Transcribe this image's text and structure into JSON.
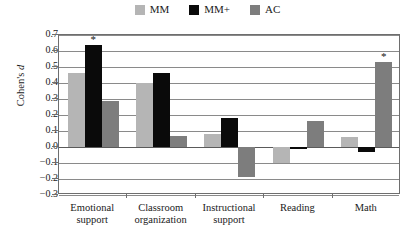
{
  "legend": {
    "position": "top-center",
    "entries": [
      {
        "label": "MM",
        "color": "#b5b5b5",
        "swatch_name": "legend-swatch-mm"
      },
      {
        "label": "MM+",
        "color": "#0a0a0a",
        "swatch_name": "legend-swatch-mmplus"
      },
      {
        "label": "AC",
        "color": "#7d7d7d",
        "swatch_name": "legend-swatch-ac"
      }
    ]
  },
  "axes": {
    "ylabel_prefix": "Cohen's ",
    "ylabel_italic": "d",
    "ytick_labels": [
      "0.7",
      "0.6",
      "0.5",
      "0.4",
      "0.3",
      "0.2",
      "0.1",
      "0.0",
      "−0.1",
      "−0.2",
      "−0.3"
    ]
  },
  "annotations": {
    "significance_marker": "*"
  },
  "chart_data": {
    "type": "bar",
    "title": "",
    "xlabel": "",
    "ylabel": "Cohen's d",
    "ylim": [
      -0.3,
      0.7
    ],
    "ytick_values": [
      0.7,
      0.6,
      0.5,
      0.4,
      0.3,
      0.2,
      0.1,
      0.0,
      -0.1,
      -0.2,
      -0.3
    ],
    "grid": true,
    "grid_axis": "y",
    "legend_position": "top-center",
    "categories": [
      "Emotional support",
      "Classroom organization",
      "Instructional support",
      "Reading",
      "Math"
    ],
    "category_lines": [
      [
        "Emotional",
        "support"
      ],
      [
        "Classroom",
        "organization"
      ],
      [
        "Instructional",
        "support"
      ],
      [
        "Reading",
        ""
      ],
      [
        "Math",
        ""
      ]
    ],
    "series": [
      {
        "name": "MM",
        "color": "#b5b5b5",
        "values": [
          0.46,
          0.4,
          0.08,
          -0.1,
          0.06
        ]
      },
      {
        "name": "MM+",
        "color": "#0a0a0a",
        "values": [
          0.64,
          0.46,
          0.18,
          -0.01,
          -0.03
        ]
      },
      {
        "name": "AC",
        "color": "#7d7d7d",
        "values": [
          0.29,
          0.07,
          -0.19,
          0.16,
          0.53
        ]
      }
    ],
    "significant": [
      {
        "category": "Emotional support",
        "series": "MM+",
        "value": 0.64,
        "marker": "*"
      },
      {
        "category": "Math",
        "series": "AC",
        "value": 0.53,
        "marker": "*"
      }
    ]
  }
}
